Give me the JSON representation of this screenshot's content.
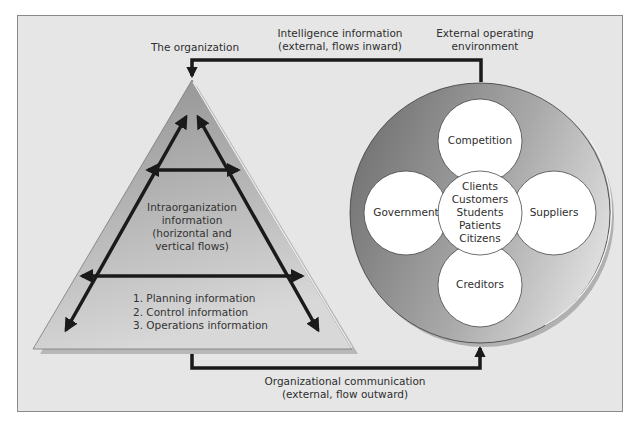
{
  "labels": {
    "organization": "The organization",
    "intelligence": [
      "Intelligence information",
      "(external, flows inward)"
    ],
    "external_env": [
      "External operating",
      "environment"
    ],
    "org_comm": [
      "Organizational communication",
      "(external, flow outward)"
    ],
    "intra": [
      "Intraorganization",
      "information",
      "(horizontal and",
      "vertical flows)"
    ],
    "info_types": [
      "1. Planning information",
      "2. Control information",
      "3. Operations information"
    ]
  },
  "environment": {
    "top": "Competition",
    "left": "Government",
    "right": "Suppliers",
    "bottom": "Creditors",
    "center": [
      "Clients",
      "Customers",
      "Students",
      "Patients",
      "Citizens"
    ]
  },
  "colors": {
    "background": "#e6e6e6",
    "frame_border": "#8a8a8a",
    "triangle_fill_top": "#9a9a9a",
    "triangle_fill_bottom": "#d4d4d4",
    "ring_dark": "#7f7f7f",
    "ring_light": "#d6d6d6",
    "arrow": "#1a1a1a",
    "text": "#2e2e2e"
  }
}
